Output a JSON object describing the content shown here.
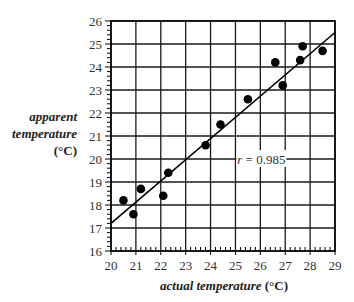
{
  "chart_data": {
    "type": "scatter",
    "title": "",
    "xlabel": "actual temperature (°C)",
    "xlabel_main": "actual temperature",
    "xlabel_unit": "(°C)",
    "ylabel": "apparent temperature (°C)",
    "ylabel_lines": [
      "apparent",
      "temperature",
      "(°C)"
    ],
    "xlim": [
      20,
      29
    ],
    "ylim": [
      16,
      26
    ],
    "xticks": [
      "20",
      "21",
      "22",
      "23",
      "24",
      "25",
      "26",
      "27",
      "28",
      "29"
    ],
    "yticks": [
      "16",
      "17",
      "18",
      "19",
      "20",
      "21",
      "22",
      "23",
      "24",
      "25",
      "26"
    ],
    "minor_ticks_per_unit": 5,
    "grid": true,
    "legend": null,
    "series": [
      {
        "name": "measurements",
        "marker": "filled-circle",
        "color": "#000000",
        "x": [
          20.5,
          20.9,
          21.2,
          22.1,
          22.3,
          23.8,
          24.4,
          25.5,
          26.6,
          26.9,
          27.6,
          27.7,
          28.5
        ],
        "y": [
          18.2,
          17.6,
          18.7,
          18.4,
          19.4,
          20.6,
          21.5,
          22.6,
          24.2,
          23.2,
          24.3,
          24.9,
          24.7
        ]
      }
    ],
    "trendline": {
      "type": "linear",
      "x": [
        20,
        29
      ],
      "y": [
        17.2,
        25.5
      ],
      "color": "#000000"
    },
    "annotations": [
      {
        "text": "r = 0.985",
        "r_symbol": "r",
        "r_value": "= 0.985",
        "x": 26.0,
        "y": 20.0
      }
    ]
  }
}
